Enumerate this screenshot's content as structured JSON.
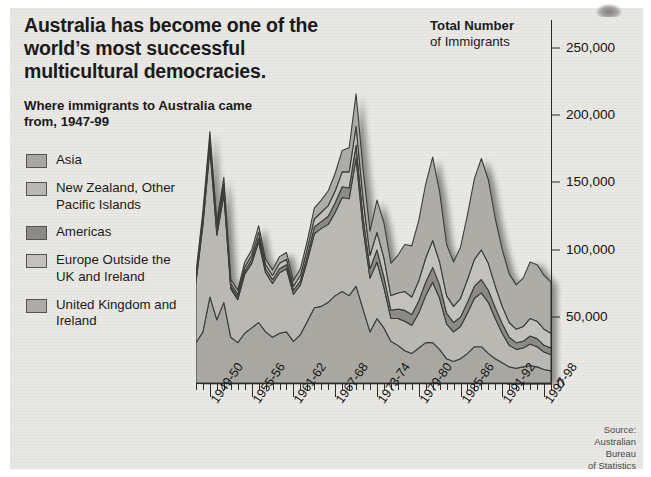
{
  "headline": "Australia has become one of the world’s most successful multicultural democracies.",
  "subhead": "Where immigrants to Australia came from, 1947-99",
  "chart_header": {
    "line1": "Total Number",
    "line2": "of Immigrants"
  },
  "source": "Source:\nAustralian\nBureau\nof Statistics",
  "legend": {
    "items": [
      {
        "label": "Asia",
        "color": "#a8a7a2"
      },
      {
        "label": "New Zealand, Other Pacific Islands",
        "color": "#b9b8b3"
      },
      {
        "label": "Americas",
        "color": "#8b8a85"
      },
      {
        "label": "Europe Outside the UK and Ireland",
        "color": "#c2c1bc"
      },
      {
        "label": "United Kingdom and Ireland",
        "color": "#adaca7"
      }
    ]
  },
  "chart_data": {
    "type": "area",
    "stacked": true,
    "title": "Total Number of Immigrants",
    "subtitle": "Where immigrants to Australia came from, 1947-99",
    "xlabel": "",
    "ylabel": "Total Number of Immigrants",
    "ylim": [
      0,
      250000
    ],
    "yticks": [
      0,
      50000,
      100000,
      150000,
      200000,
      250000
    ],
    "ytick_labels": [
      "0",
      "50,000",
      "100,000",
      "150,000",
      "200,000",
      "250,000"
    ],
    "grid": false,
    "legend_position": "left",
    "x": [
      "1947-48",
      "1948-49",
      "1949-50",
      "1950-51",
      "1951-52",
      "1952-53",
      "1953-54",
      "1954-55",
      "1955-56",
      "1956-57",
      "1957-58",
      "1958-59",
      "1959-60",
      "1960-61",
      "1961-62",
      "1962-63",
      "1963-64",
      "1964-65",
      "1965-66",
      "1966-67",
      "1967-68",
      "1968-69",
      "1969-70",
      "1970-71",
      "1971-72",
      "1972-73",
      "1973-74",
      "1974-75",
      "1975-76",
      "1976-77",
      "1977-78",
      "1978-79",
      "1979-80",
      "1980-81",
      "1981-82",
      "1982-83",
      "1983-84",
      "1984-85",
      "1985-86",
      "1986-87",
      "1987-88",
      "1988-89",
      "1989-90",
      "1990-91",
      "1991-92",
      "1992-93",
      "1993-94",
      "1994-95",
      "1995-96",
      "1996-97",
      "1997-98",
      "1998-99"
    ],
    "x_tick_labels": [
      "1949-50",
      "1955-56",
      "1961-62",
      "1967-68",
      "1973-74",
      "1979-80",
      "1985-86",
      "1991-92",
      "1997-98"
    ],
    "x_tick_label_indices": [
      2,
      8,
      14,
      20,
      26,
      32,
      38,
      44,
      50
    ],
    "series": [
      {
        "name": "United Kingdom and Ireland",
        "values": [
          30000,
          38000,
          64000,
          47000,
          60000,
          34000,
          30000,
          37000,
          41000,
          45000,
          38000,
          34000,
          37000,
          38000,
          31000,
          36000,
          46000,
          56000,
          57000,
          60000,
          65000,
          68000,
          65000,
          72000,
          55000,
          38000,
          48000,
          41000,
          31000,
          28000,
          24000,
          22000,
          26000,
          30000,
          30000,
          25000,
          18000,
          16000,
          18000,
          22000,
          27000,
          27000,
          22000,
          18000,
          15000,
          12000,
          11000,
          12000,
          13000,
          12000,
          10000,
          9000
        ]
      },
      {
        "name": "Europe Outside the UK and Ireland",
        "values": [
          45000,
          80000,
          110000,
          63000,
          80000,
          36000,
          32000,
          44000,
          48000,
          60000,
          44000,
          40000,
          45000,
          47000,
          35000,
          37000,
          45000,
          55000,
          58000,
          58000,
          62000,
          70000,
          72000,
          95000,
          60000,
          40000,
          42000,
          30000,
          17000,
          20000,
          22000,
          21000,
          26000,
          35000,
          45000,
          38000,
          26000,
          22000,
          24000,
          30000,
          36000,
          40000,
          38000,
          30000,
          22000,
          16000,
          14000,
          14000,
          16000,
          15000,
          13000,
          12000
        ]
      },
      {
        "name": "Americas",
        "values": [
          2000,
          3000,
          4000,
          3000,
          4000,
          2000,
          2000,
          2000,
          3000,
          3000,
          3000,
          3000,
          3000,
          3000,
          3000,
          3000,
          4000,
          5000,
          5000,
          6000,
          7000,
          8000,
          8000,
          10000,
          9000,
          7000,
          9000,
          8000,
          6000,
          7000,
          8000,
          8000,
          9000,
          10000,
          11000,
          10000,
          8000,
          7000,
          7000,
          8000,
          9000,
          10000,
          9000,
          8000,
          7000,
          6000,
          5000,
          5000,
          6000,
          6000,
          5000,
          5000
        ]
      },
      {
        "name": "New Zealand, Other Pacific Islands",
        "values": [
          2000,
          3000,
          4000,
          3000,
          4000,
          2000,
          2000,
          3000,
          3000,
          4000,
          3000,
          3000,
          4000,
          4000,
          3000,
          4000,
          5000,
          6000,
          7000,
          8000,
          9000,
          11000,
          12000,
          14000,
          13000,
          10000,
          13000,
          14000,
          11000,
          12000,
          14000,
          13000,
          15000,
          18000,
          20000,
          17000,
          13000,
          12000,
          14000,
          17000,
          20000,
          22000,
          20000,
          16000,
          13000,
          11000,
          10000,
          11000,
          13000,
          13000,
          12000,
          11000
        ]
      },
      {
        "name": "Asia",
        "values": [
          3000,
          4000,
          5000,
          4000,
          5000,
          3000,
          3000,
          4000,
          4000,
          5000,
          4000,
          4000,
          5000,
          5000,
          4000,
          5000,
          6000,
          8000,
          9000,
          11000,
          13000,
          16000,
          18000,
          24000,
          22000,
          18000,
          24000,
          26000,
          24000,
          28000,
          35000,
          38000,
          45000,
          55000,
          62000,
          52000,
          38000,
          33000,
          38000,
          48000,
          60000,
          68000,
          62000,
          50000,
          42000,
          36000,
          33000,
          36000,
          42000,
          42000,
          40000,
          38000
        ]
      }
    ]
  }
}
